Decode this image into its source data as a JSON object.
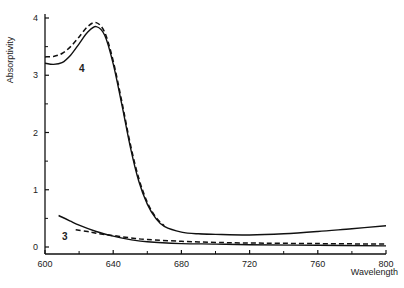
{
  "chart_data": {
    "type": "line",
    "title": "",
    "xlabel": "Wavelength",
    "ylabel": "Absorptivity",
    "xlim": [
      600,
      800
    ],
    "ylim": [
      0,
      4
    ],
    "grid": false,
    "legend": "none",
    "x_ticks_major": [
      600,
      640,
      680,
      720,
      760,
      800
    ],
    "x_ticks_minor": [
      620,
      660,
      700,
      740,
      780
    ],
    "y_ticks_major": [
      0,
      1,
      2,
      3,
      4
    ],
    "y_ticks_minor": [
      0.5,
      1.5,
      2.5,
      3.5
    ],
    "annotations": [
      {
        "text": "4",
        "x": 620,
        "y": 3.05
      },
      {
        "text": "3",
        "x": 610,
        "y": 0.12
      }
    ],
    "series": [
      {
        "name": "4 (solid)",
        "style": "solid",
        "x": [
          600,
          605,
          610,
          615,
          620,
          625,
          630,
          635,
          640,
          645,
          650,
          655,
          660,
          665,
          670,
          680,
          690,
          700,
          720,
          740,
          760,
          780,
          800
        ],
        "y": [
          3.21,
          3.19,
          3.22,
          3.35,
          3.55,
          3.75,
          3.85,
          3.7,
          3.2,
          2.5,
          1.75,
          1.15,
          0.75,
          0.5,
          0.36,
          0.26,
          0.23,
          0.22,
          0.21,
          0.23,
          0.27,
          0.32,
          0.37
        ]
      },
      {
        "name": "4 (dashed)",
        "style": "dashed",
        "x": [
          600,
          605,
          610,
          615,
          620,
          625,
          630,
          635,
          640,
          645,
          650,
          655,
          660,
          665,
          670
        ],
        "y": [
          3.32,
          3.33,
          3.38,
          3.5,
          3.67,
          3.85,
          3.92,
          3.75,
          3.25,
          2.55,
          1.8,
          1.2,
          0.78,
          0.52,
          0.37
        ]
      },
      {
        "name": "3 (solid)",
        "style": "solid",
        "x": [
          608,
          615,
          620,
          630,
          640,
          650,
          660,
          680,
          700,
          720,
          760,
          800
        ],
        "y": [
          0.55,
          0.45,
          0.38,
          0.27,
          0.19,
          0.13,
          0.09,
          0.06,
          0.05,
          0.04,
          0.03,
          0.02
        ]
      },
      {
        "name": "3 (dashed)",
        "style": "dashed",
        "x": [
          618,
          625,
          630,
          640,
          650,
          660,
          680,
          700,
          720,
          760,
          800
        ],
        "y": [
          0.3,
          0.27,
          0.24,
          0.2,
          0.16,
          0.13,
          0.1,
          0.08,
          0.07,
          0.06,
          0.05
        ]
      }
    ]
  },
  "axes": {
    "x_title": "Wavelength",
    "y_title": "Absorptivity"
  }
}
